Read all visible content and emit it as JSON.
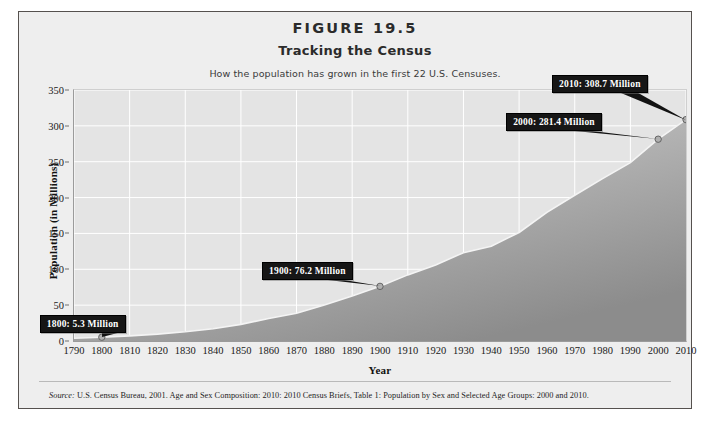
{
  "figure": {
    "number": "FIGURE 19.5",
    "title": "Tracking the Census",
    "subtitle": "How the population has grown in the first 22 U.S. Censuses.",
    "source_label": "Source:",
    "source_text": " U.S. Census Bureau, 2001. Age and Sex Composition: 2010: 2010 Census Briefs, Table 1: Population by Sex and Selected Age Groups: 2000 and 2010.",
    "border_color": "#55514e",
    "background_color": "#eeeeee"
  },
  "chart_data": {
    "type": "area",
    "title": "Tracking the Census",
    "subtitle": "How the population has grown in the first 22 U.S. Censuses.",
    "xlabel": "Year",
    "ylabel": "Population (in Millions)",
    "xlim": [
      1790,
      2010
    ],
    "ylim": [
      0,
      350
    ],
    "grid": true,
    "legend": "none",
    "plot_bg_color": "#e4e4e4",
    "gridline_color": "#ffffff",
    "area_fill_top_color": "#d3d3d3",
    "area_fill_bottom_color": "#8e8e8e",
    "line_color": "#f2f2f2",
    "x": [
      1790,
      1800,
      1810,
      1820,
      1830,
      1840,
      1850,
      1860,
      1870,
      1880,
      1890,
      1900,
      1910,
      1920,
      1930,
      1940,
      1950,
      1960,
      1970,
      1980,
      1990,
      2000,
      2010
    ],
    "y": [
      3.9,
      5.3,
      7.2,
      9.6,
      12.9,
      17.1,
      23.2,
      31.4,
      38.6,
      50.2,
      62.9,
      76.2,
      92.2,
      106.0,
      123.2,
      132.2,
      151.3,
      179.3,
      203.3,
      226.5,
      248.7,
      281.4,
      308.7
    ],
    "ytick_labels": [
      "0",
      "50",
      "100",
      "150",
      "200",
      "250",
      "300",
      "350"
    ],
    "ytick_values": [
      0,
      50,
      100,
      150,
      200,
      250,
      300,
      350
    ],
    "xtick_labels": [
      "1790",
      "1800",
      "1810",
      "1820",
      "1830",
      "1840",
      "1850",
      "1860",
      "1870",
      "1880",
      "1890",
      "1900",
      "1910",
      "1920",
      "1930",
      "1940",
      "1950",
      "1960",
      "1970",
      "1980",
      "1990",
      "2000",
      "2010"
    ],
    "annotations": [
      {
        "label": "1800: 5.3 Million",
        "year": 1800,
        "value": 5.3
      },
      {
        "label": "1900: 76.2 Million",
        "year": 1900,
        "value": 76.2
      },
      {
        "label": "2000: 281.4 Million",
        "year": 2000,
        "value": 281.4
      },
      {
        "label": "2010: 308.7 Million",
        "year": 2010,
        "value": 308.7
      }
    ]
  }
}
